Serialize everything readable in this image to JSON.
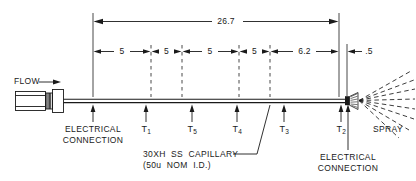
{
  "diagram": {
    "title_visible": false,
    "flow_label": "FLOW",
    "spray_label": "SPRAY",
    "capillary_label_line1": "30XH  SS  CAPILLARY",
    "capillary_label_line2": "(50u  NOM  I.D.)",
    "electrical_connection_left": {
      "line1": "ELECTRICAL",
      "line2": "CONNECTION"
    },
    "electrical_connection_right": {
      "line1": "ELECTRICAL",
      "line2": "CONNECTION"
    },
    "overall_dimension": {
      "value": "26.7",
      "x_center": 226
    },
    "segment_dimensions": [
      {
        "value": "5",
        "x_center": 122,
        "x_start": 93,
        "x_end": 151
      },
      {
        "value": "5",
        "x_center": 166,
        "x_start": 151,
        "x_end": 182
      },
      {
        "value": "5",
        "x_center": 210,
        "x_start": 182,
        "x_end": 239
      },
      {
        "value": "5",
        "x_center": 254,
        "x_start": 239,
        "x_end": 270
      },
      {
        "value": "6.2",
        "x_center": 304,
        "x_start": 270,
        "x_end": 339
      },
      {
        "value": ".5",
        "x_center": 371,
        "x_start": 347,
        "x_end": 390
      }
    ],
    "thermocouples": [
      {
        "label": "T",
        "sub": "1",
        "x": 146
      },
      {
        "label": "T",
        "sub": "5",
        "x": 192
      },
      {
        "label": "T",
        "sub": "4",
        "x": 237
      },
      {
        "label": "T",
        "sub": "3",
        "x": 284
      },
      {
        "label": "T",
        "sub": "2",
        "x": 344
      }
    ],
    "colors": {
      "line": "#1a1a1a",
      "text": "#1a1a1a",
      "background": "#ffffff"
    }
  }
}
